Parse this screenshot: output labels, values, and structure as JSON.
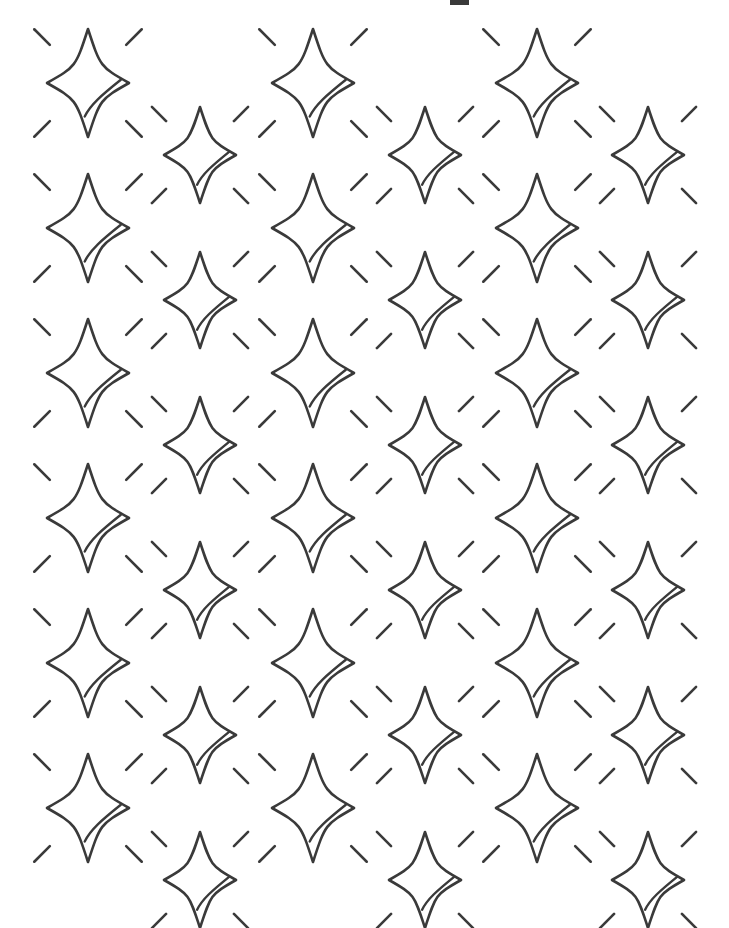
{
  "page": {
    "width": 729,
    "height": 928,
    "background_color": "#ffffff",
    "motif_name": "four-pointed-sparkle-star"
  },
  "style": {
    "stroke_color": "#3a3a3a",
    "stroke_width": 2.6,
    "ray_stroke_width": 2.6,
    "swoosh_stroke_width": 2.4,
    "fill": "none"
  },
  "artifact": {
    "label": "top-edge-crop-mark",
    "x": 450,
    "y": 0,
    "width": 19,
    "height": 5,
    "color": "#3a3a3a"
  },
  "motif": {
    "name": "sparkle-star",
    "point_count": 4,
    "side_curvature": "concave",
    "has_inner_swoosh": true,
    "ray_count": 4,
    "ray_positions": [
      "northwest",
      "northeast",
      "southwest",
      "southeast"
    ]
  },
  "pattern": {
    "type": "interleaved-offset-grid",
    "column_pitch": 224,
    "row_pitch": 145,
    "grids": [
      {
        "name": "primary-grid",
        "size_label": "large",
        "half_width": 41,
        "half_height": 54,
        "ray_inner": 54,
        "ray_outer": 76,
        "columns_x": [
          88,
          313,
          537
        ],
        "rows_y": [
          83,
          228,
          373,
          518,
          663,
          808
        ]
      },
      {
        "name": "offset-grid",
        "size_label": "small",
        "half_width": 36,
        "half_height": 48,
        "ray_inner": 48,
        "ray_outer": 68,
        "columns_x": [
          200,
          425,
          648
        ],
        "rows_y": [
          155,
          300,
          445,
          590,
          735,
          880
        ]
      }
    ],
    "total_star_count": 36
  }
}
